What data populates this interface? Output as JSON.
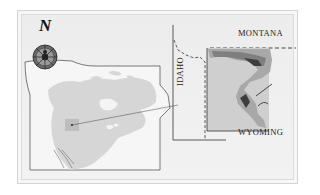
{
  "map": {
    "north_label": "N",
    "compass_icon": "compass-rose-icon",
    "overview_region": "North America",
    "inset": {
      "labels": {
        "montana": "MONTANA",
        "idaho": "IDAHO",
        "wyoming": "WYOMING"
      }
    },
    "colors": {
      "land": "#d6d6d6",
      "ocean": "#f4f4f4",
      "highlight_box": "#bdbdbd",
      "shade_light": "#a8a8a8",
      "shade_mid": "#7f7f7f",
      "shade_dark": "#3d3d3d",
      "line": "#333333"
    }
  }
}
